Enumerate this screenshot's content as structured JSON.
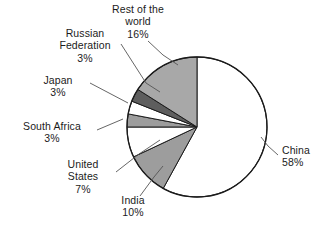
{
  "chart_data": {
    "type": "pie",
    "title": "",
    "subtitle": "",
    "xlabel": "",
    "ylabel": "",
    "legend": "none",
    "grid": false,
    "start_angle_deg": 0,
    "direction": "clockwise",
    "units": "percent",
    "categories": [
      "China",
      "India",
      "United States",
      "South Africa",
      "Japan",
      "Russian Federation",
      "Rest of the world"
    ],
    "values": [
      58,
      10,
      7,
      3,
      3,
      3,
      16
    ],
    "slices": [
      {
        "label": "China",
        "name_line1": "China",
        "value_text": "58%",
        "value": 58,
        "fill": "#ffffff",
        "stroke": "#1b1b1b",
        "start_deg": 0,
        "end_deg": 208.8
      },
      {
        "label": "India",
        "name_line1": "India",
        "value_text": "10%",
        "value": 10,
        "fill": "#9d9d9d",
        "stroke": "#1b1b1b",
        "start_deg": 208.8,
        "end_deg": 244.8
      },
      {
        "label": "United States",
        "name_line1": "United",
        "name_line2": "States",
        "value_text": "7%",
        "value": 7,
        "fill": "#ffffff",
        "stroke": "#1b1b1b",
        "start_deg": 244.8,
        "end_deg": 270.0
      },
      {
        "label": "South Africa",
        "name_line1": "South Africa",
        "value_text": "3%",
        "value": 3,
        "fill": "#9d9d9d",
        "stroke": "#1b1b1b",
        "start_deg": 270.0,
        "end_deg": 280.8
      },
      {
        "label": "Japan",
        "name_line1": "Japan",
        "value_text": "3%",
        "value": 3,
        "fill": "#ffffff",
        "stroke": "#1b1b1b",
        "start_deg": 280.8,
        "end_deg": 291.6
      },
      {
        "label": "Russian Federation",
        "name_line1": "Russian",
        "name_line2": "Federation",
        "value_text": "3%",
        "value": 3,
        "fill": "#5e5e5e",
        "stroke": "#1b1b1b",
        "start_deg": 291.6,
        "end_deg": 302.4
      },
      {
        "label": "Rest of the world",
        "name_line1": "Rest of the",
        "name_line2": "world",
        "value_text": "16%",
        "value": 16,
        "fill": "#a8a8a8",
        "stroke": "#1b1b1b",
        "start_deg": 302.4,
        "end_deg": 360.0
      }
    ],
    "colors": {
      "outline": "#1b1b1b",
      "leader_line": "#555555",
      "white_slice": "#ffffff",
      "light_gray_slice": "#a8a8a8",
      "mid_gray_slice": "#9d9d9d",
      "dark_gray_slice": "#5e5e5e",
      "background": "#ffffff",
      "text": "#1b1b1b"
    }
  },
  "labels": {
    "rest_of_the_world": {
      "line1": "Rest of the",
      "line2": "world",
      "value": "16%"
    },
    "russian_federation": {
      "line1": "Russian",
      "line2": "Federation",
      "value": "3%"
    },
    "japan": {
      "line1": "Japan",
      "value": "3%"
    },
    "south_africa": {
      "line1": "South Africa",
      "value": "3%"
    },
    "united_states": {
      "line1": "United",
      "line2": "States",
      "value": "7%"
    },
    "india": {
      "line1": "India",
      "value": "10%"
    },
    "china": {
      "line1": "China",
      "value": "58%"
    }
  }
}
